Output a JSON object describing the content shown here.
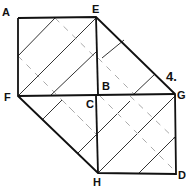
{
  "figure": {
    "number_label": "4.",
    "vertices": {
      "A": "A",
      "E": "E",
      "F": "F",
      "B": "B",
      "C": "C",
      "G": "G",
      "H": "H",
      "D": "D"
    }
  },
  "colors": {
    "stroke": "#111111",
    "hatch": "#444444",
    "dash": "#bbbbbb"
  }
}
